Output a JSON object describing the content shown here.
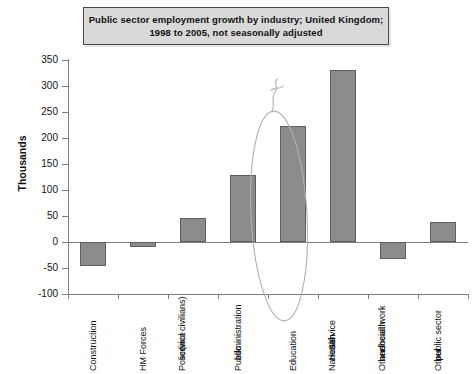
{
  "title": {
    "line1": "Public sector employment growth by industry; United Kingdom;",
    "line2": "1998 to 2005, not seasonally adjusted"
  },
  "axis": {
    "y_title": "Thousands"
  },
  "annotation": {
    "highlight_category": "Education",
    "shape": "hand-drawn-ellipse",
    "mark": "hand-drawn-squiggle"
  },
  "chart_data": {
    "type": "bar",
    "title": "Public sector employment growth by industry; United Kingdom; 1998 to 2005, not seasonally adjusted",
    "xlabel": "",
    "ylabel": "Thousands",
    "ylim": [
      -100,
      350
    ],
    "yticks": [
      350,
      300,
      250,
      200,
      150,
      100,
      50,
      0,
      -50,
      -100
    ],
    "ytick_labels": [
      "350",
      "300",
      "250",
      "200",
      "150",
      "100",
      "50",
      "0",
      "-50",
      "-100"
    ],
    "grid": false,
    "legend": "none",
    "bar_color": "#8c8c8c",
    "bar_edge_color": "#5e5e5e",
    "categories": [
      "Construction",
      "HM Forces",
      "Police service (incl civilians)",
      "Public administration",
      "Education",
      "National Health Service",
      "Other health and social work",
      "Other public sector"
    ],
    "category_lines": [
      [
        "Construction"
      ],
      [
        "HM Forces"
      ],
      [
        "Police",
        "service",
        "(incl civilians)"
      ],
      [
        "Public",
        "administration"
      ],
      [
        "Education"
      ],
      [
        "National",
        "Health",
        "Service"
      ],
      [
        "Other health",
        "and",
        "social work"
      ],
      [
        "Other",
        "public sector"
      ]
    ],
    "values": [
      -46,
      -10,
      46,
      128,
      223,
      330,
      -33,
      38
    ]
  }
}
